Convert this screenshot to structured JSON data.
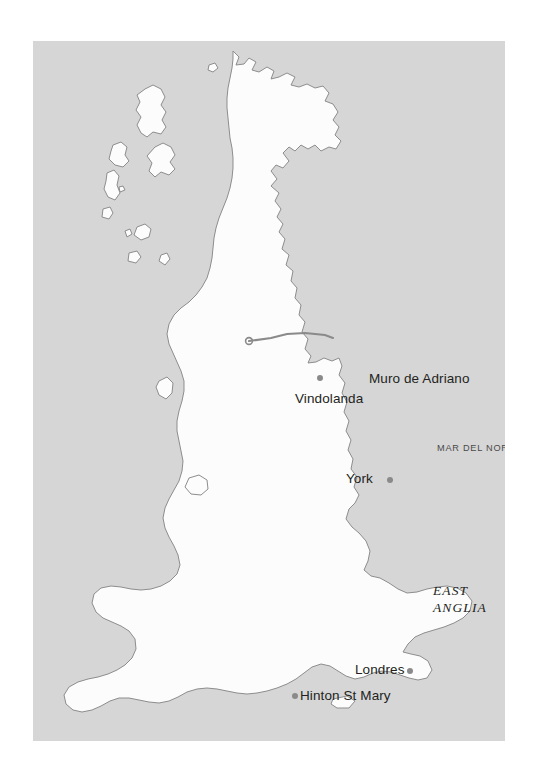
{
  "map": {
    "title": "Roman Britain map",
    "plate": {
      "left": 33,
      "top": 41,
      "width": 472,
      "height": 700,
      "sea_color": "#d5d5d5",
      "land_color": "#fbfbfb",
      "coast_stroke": "#8f8f8f",
      "wall_color": "#8a8a8a",
      "dot_color": "#8a8a8a",
      "text_color": "#231f20"
    },
    "places": [
      {
        "id": "muro-de-adriano",
        "label": "Muro de Adriano",
        "dot_side": "none",
        "kind": "monument"
      },
      {
        "id": "vindolanda",
        "label": "Vindolanda",
        "dot_side": "above",
        "kind": "fort"
      },
      {
        "id": "york",
        "label": "York",
        "dot_side": "right",
        "kind": "city"
      },
      {
        "id": "londres",
        "label": "Londres",
        "dot_side": "right",
        "kind": "city"
      },
      {
        "id": "hinton-st-mary",
        "label": "Hinton St Mary",
        "dot_side": "left",
        "kind": "site"
      }
    ],
    "sea_labels": [
      {
        "id": "mar-del-norte",
        "label": "MAR DEL NORTE"
      }
    ],
    "region_labels": [
      {
        "id": "east-anglia",
        "line1": "EAST",
        "line2": "ANGLIA"
      }
    ]
  }
}
